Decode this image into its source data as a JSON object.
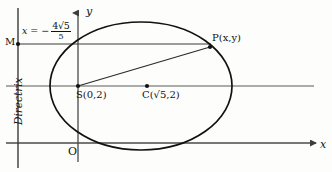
{
  "figure": {
    "background_color": "#fdfdfb",
    "ink_color": "#111111",
    "axis_color": "#4a4a4a",
    "curve_color": "#111111"
  },
  "axes": {
    "y_label": "y",
    "x_label": "x",
    "origin_label": "O",
    "origin_px": {
      "x": 78,
      "y": 143
    },
    "x_axis_y_px": 143,
    "y_axis_x_px": 78
  },
  "directrix": {
    "caption": "Directrix",
    "equation": {
      "variable": "x",
      "equals": "=",
      "sign": "−",
      "numerator": "4√5",
      "denominator": "5",
      "full_text": "x = -4√5/5"
    },
    "line_x_px": 18
  },
  "points": [
    {
      "name": "M",
      "label": "M",
      "x_px": 18,
      "y_px": 44,
      "dot": true
    },
    {
      "name": "S",
      "label": "S(0,2)",
      "x_px": 78,
      "y_px": 86,
      "dot": true
    },
    {
      "name": "C",
      "label": "C(√5,2)",
      "x_px": 147,
      "y_px": 86,
      "dot": true
    },
    {
      "name": "P",
      "label": "P(x,y)",
      "x_px": 209,
      "y_px": 48,
      "dot": true
    }
  ],
  "ellipse": {
    "center_px": {
      "x": 141,
      "y": 86
    },
    "semi_major_px": 91,
    "semi_minor_px": 64,
    "stroke_width": 1.6
  },
  "segments": [
    {
      "name": "MP",
      "from": "M",
      "to": "P",
      "description": "horizontal from directrix point M to P"
    },
    {
      "name": "SP",
      "from": "S",
      "to": "P",
      "description": "focal radius from focus S to P"
    },
    {
      "name": "horizontal-through-S",
      "description": "line y = 2 through S and C"
    }
  ]
}
